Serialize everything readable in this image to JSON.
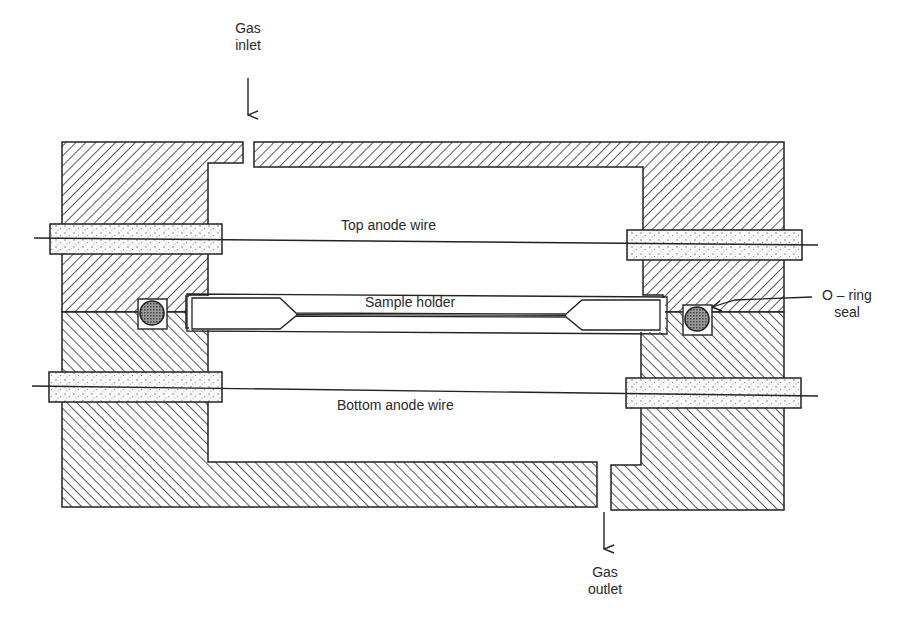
{
  "diagram": {
    "type": "cross-section schematic",
    "colors": {
      "ink": "#222222",
      "background": "#ffffff",
      "hatch": "#333333",
      "insulator_dots": "#555555"
    }
  },
  "labels": {
    "gas_inlet": {
      "line1": "Gas",
      "line2": "inlet"
    },
    "gas_outlet": {
      "line1": "Gas",
      "line2": "outlet"
    },
    "top_anode_wire": "Top anode wire",
    "sample_holder": "Sample holder",
    "bottom_anode_wire": "Bottom anode wire",
    "o_ring_seal": {
      "line1": "O – ring",
      "line2": "seal"
    }
  },
  "components": [
    {
      "id": "upper-body",
      "name": "Upper housing block",
      "fill": "hatched (/)"
    },
    {
      "id": "lower-body",
      "name": "Lower housing block",
      "fill": "hatched (\\)"
    },
    {
      "id": "top-insulators",
      "name": "Top anode wire insulating feedthroughs",
      "fill": "stippled"
    },
    {
      "id": "bottom-insulators",
      "name": "Bottom anode wire insulating feedthroughs",
      "fill": "stippled"
    },
    {
      "id": "o-rings",
      "name": "O-ring seals (left and right)",
      "fill": "cross-hatched"
    },
    {
      "id": "sample-holder",
      "name": "Sample holder",
      "fill": "none"
    },
    {
      "id": "gas-inlet-arrow",
      "name": "Gas inlet arrow",
      "direction": "down"
    },
    {
      "id": "gas-outlet-arrow",
      "name": "Gas outlet arrow",
      "direction": "down"
    }
  ]
}
